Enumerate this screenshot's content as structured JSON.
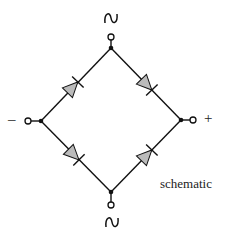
{
  "diagram": {
    "caption": "schematic",
    "terminals": {
      "ac_top": "~",
      "ac_bottom": "~",
      "negative": "–",
      "positive": "+"
    },
    "components": [
      {
        "type": "diode",
        "name": "D1",
        "from": "negative-node",
        "to": "top-node"
      },
      {
        "type": "diode",
        "name": "D2",
        "from": "top-node",
        "to": "positive-node"
      },
      {
        "type": "diode",
        "name": "D3",
        "from": "negative-node",
        "to": "bottom-node"
      },
      {
        "type": "diode",
        "name": "D4",
        "from": "bottom-node",
        "to": "positive-node"
      }
    ],
    "colors": {
      "line": "#111111",
      "diode_fill": "#bbbbbb"
    }
  }
}
